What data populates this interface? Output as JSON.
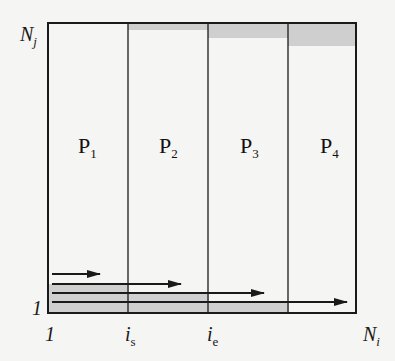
{
  "axes": {
    "y_top": {
      "main": "N",
      "sub": "j"
    },
    "y_bottom": "1",
    "x_left": "1",
    "x_is": {
      "main": "i",
      "sub": "s"
    },
    "x_ie": {
      "main": "i",
      "sub": "e"
    },
    "x_right": {
      "main": "N",
      "sub": "i"
    }
  },
  "processors": [
    {
      "main": "P",
      "sub": "1"
    },
    {
      "main": "P",
      "sub": "2"
    },
    {
      "main": "P",
      "sub": "3"
    },
    {
      "main": "P",
      "sub": "4"
    }
  ],
  "colors": {
    "background": "#f5f5f3",
    "line": "#1a1a1a",
    "shade": "#cfcfcf"
  }
}
